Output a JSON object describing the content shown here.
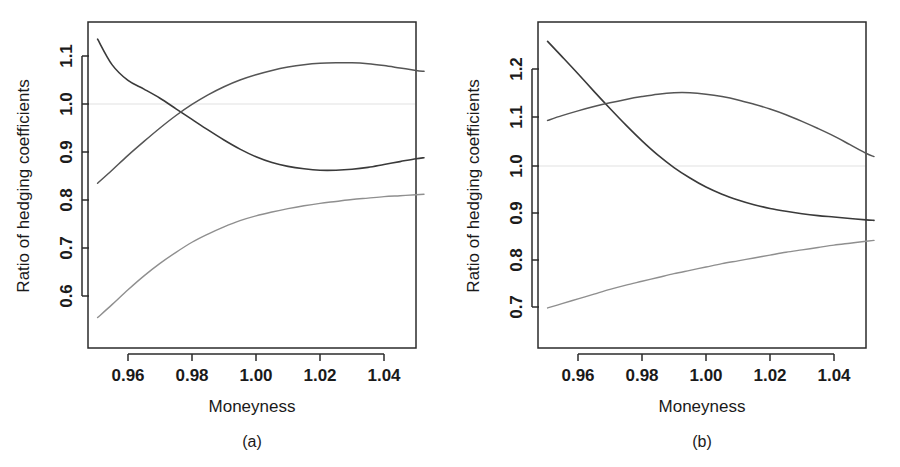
{
  "figure": {
    "background": "#ffffff",
    "curve_colors": {
      "dark": "#3a3a3a",
      "mid": "#555555",
      "light": "#8f8f8f",
      "reference": "#ebebeb"
    }
  },
  "panels": [
    {
      "id": "a",
      "caption": "(a)",
      "xlabel": "Moneyness",
      "ylabel": "Ratio of hedging coefficients",
      "xticks": [
        "0.96",
        "0.98",
        "1.00",
        "1.02",
        "1.04"
      ],
      "yticks": [
        "1.1",
        "1.0",
        "0.9",
        "0.8",
        "0.7",
        "0.6"
      ]
    },
    {
      "id": "b",
      "caption": "(b)",
      "xlabel": "Moneyness",
      "ylabel": "Ratio of hedging coefficients",
      "xticks": [
        "0.96",
        "0.98",
        "1.00",
        "1.02",
        "1.04"
      ],
      "yticks": [
        "1.2",
        "1.1",
        "1.0",
        "0.9",
        "0.8",
        "0.7"
      ]
    }
  ],
  "chart_data": [
    {
      "type": "line",
      "panel": "a",
      "title": "",
      "xlabel": "Moneyness",
      "ylabel": "Ratio of hedging coefficients",
      "xlim": [
        0.9495,
        1.0535
      ],
      "ylim": [
        0.548,
        1.143
      ],
      "xticks": [
        0.96,
        0.98,
        1.0,
        1.02,
        1.04
      ],
      "yticks": [
        0.6,
        0.7,
        0.8,
        0.9,
        1.0,
        1.1
      ],
      "grid": false,
      "legend": "none",
      "annotations": [
        "horizontal reference line at y = 1.0"
      ],
      "reference_line_y": 1.0,
      "x": [
        0.9505,
        0.955,
        0.96,
        0.965,
        0.97,
        0.975,
        0.98,
        0.985,
        0.99,
        0.995,
        1.0,
        1.005,
        1.01,
        1.015,
        1.02,
        1.025,
        1.03,
        1.035,
        1.04,
        1.045,
        1.05,
        1.0525
      ],
      "series": [
        {
          "name": "decreasing-curve",
          "color": "#3a3a3a",
          "values": [
            1.135,
            1.082,
            1.049,
            1.031,
            1.012,
            0.99,
            0.968,
            0.946,
            0.925,
            0.906,
            0.89,
            0.878,
            0.87,
            0.865,
            0.862,
            0.862,
            0.864,
            0.868,
            0.874,
            0.88,
            0.886,
            0.888
          ]
        },
        {
          "name": "increasing-curve",
          "color": "#555555",
          "values": [
            0.835,
            0.862,
            0.893,
            0.922,
            0.95,
            0.976,
            0.999,
            1.019,
            1.036,
            1.05,
            1.061,
            1.07,
            1.077,
            1.082,
            1.085,
            1.086,
            1.086,
            1.084,
            1.08,
            1.075,
            1.07,
            1.068
          ]
        },
        {
          "name": "lower-increasing-curve",
          "color": "#8f8f8f",
          "values": [
            0.555,
            0.582,
            0.613,
            0.642,
            0.668,
            0.691,
            0.712,
            0.729,
            0.744,
            0.757,
            0.767,
            0.775,
            0.782,
            0.788,
            0.793,
            0.797,
            0.801,
            0.804,
            0.807,
            0.809,
            0.811,
            0.812
          ]
        }
      ]
    },
    {
      "type": "line",
      "panel": "b",
      "title": "",
      "xlabel": "Moneyness",
      "ylabel": "Ratio of hedging coefficients",
      "xlim": [
        0.9495,
        1.0535
      ],
      "ylim": [
        0.692,
        1.262
      ],
      "xticks": [
        0.96,
        0.98,
        1.0,
        1.02,
        1.04
      ],
      "yticks": [
        0.7,
        0.8,
        0.9,
        1.0,
        1.1,
        1.2
      ],
      "grid": false,
      "legend": "none",
      "annotations": [
        "horizontal reference line at y = 1.0"
      ],
      "reference_line_y": 1.0,
      "x": [
        0.9505,
        0.955,
        0.96,
        0.965,
        0.97,
        0.975,
        0.98,
        0.985,
        0.99,
        0.995,
        1.0,
        1.005,
        1.01,
        1.015,
        1.02,
        1.025,
        1.03,
        1.035,
        1.04,
        1.045,
        1.05,
        1.0525
      ],
      "series": [
        {
          "name": "decreasing-curve",
          "color": "#3a3a3a",
          "values": [
            1.258,
            1.226,
            1.19,
            1.153,
            1.117,
            1.082,
            1.049,
            1.019,
            0.993,
            0.971,
            0.952,
            0.937,
            0.925,
            0.915,
            0.907,
            0.901,
            0.896,
            0.892,
            0.889,
            0.886,
            0.883,
            0.882
          ]
        },
        {
          "name": "hump-curve",
          "color": "#555555",
          "values": [
            1.092,
            1.102,
            1.112,
            1.121,
            1.129,
            1.136,
            1.142,
            1.147,
            1.15,
            1.15,
            1.147,
            1.142,
            1.135,
            1.126,
            1.116,
            1.104,
            1.09,
            1.075,
            1.059,
            1.041,
            1.023,
            1.016
          ]
        },
        {
          "name": "lower-increasing-curve",
          "color": "#8f8f8f",
          "values": [
            0.698,
            0.707,
            0.717,
            0.727,
            0.737,
            0.746,
            0.754,
            0.762,
            0.77,
            0.777,
            0.784,
            0.791,
            0.797,
            0.803,
            0.809,
            0.815,
            0.82,
            0.825,
            0.83,
            0.834,
            0.838,
            0.84
          ]
        }
      ]
    }
  ]
}
